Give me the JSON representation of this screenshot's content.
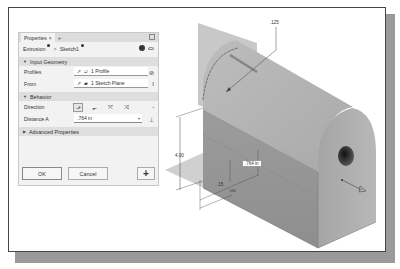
{
  "panel": {
    "tab_label": "Properties",
    "tab_close": "×",
    "tab_add": "+",
    "breadcrumb": [
      "Extrusion",
      "Sketch1"
    ],
    "breadcrumb_separator": ">",
    "sections": {
      "input_geometry": {
        "title": "Input Geometry",
        "profiles_label": "Profiles",
        "profiles_value": "1 Profile",
        "from_label": "From",
        "from_value": "1 Sketch Plane"
      },
      "behavior": {
        "title": "Behavior",
        "direction_label": "Direction",
        "direction_options": [
          "default",
          "flipped",
          "symmetric",
          "asymmetric"
        ],
        "direction_selected": "default",
        "distance_label": "Distance A",
        "distance_value": ".764 in"
      },
      "advanced": {
        "title": "Advanced Properties"
      }
    },
    "buttons": {
      "ok": "OK",
      "cancel": "Cancel",
      "add": "+"
    }
  },
  "viewport": {
    "dimensions": {
      "radius": ".125",
      "height": "4.00",
      "offset_small": ".15",
      "offset_small2": ".560",
      "distance_tag": ".764 in"
    }
  }
}
